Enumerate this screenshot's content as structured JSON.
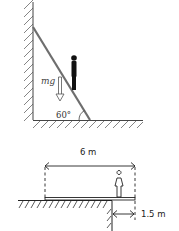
{
  "figure_top": {
    "title": "Ladder leaning against wall",
    "force_label": "mg",
    "angle_label": "60°",
    "elements": [
      "wall",
      "floor",
      "ladder",
      "person",
      "weight-arrow"
    ]
  },
  "figure_bottom": {
    "title": "Plank overhanging cliff",
    "length_label": "6 m",
    "overhang_label": "1.5 m",
    "elements": [
      "ground",
      "cliff",
      "plank",
      "person",
      "length-dimension",
      "overhang-dimension"
    ]
  },
  "colors": {
    "ink": "#222222",
    "ladder": "#6e6e6e",
    "hatch": "#555555"
  }
}
